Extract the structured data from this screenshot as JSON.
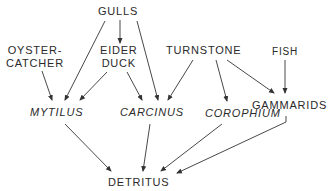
{
  "diagram": {
    "type": "food-web",
    "nodes": {
      "gulls": "GULLS",
      "oystercatcher_line1": "OYSTER-",
      "oystercatcher_line2": "CATCHER",
      "eider_line1": "EIDER",
      "eider_line2": "DUCK",
      "turnstone": "TURNSTONE",
      "fish": "FISH",
      "mytilus": "MYTILUS",
      "carcinus": "CARCINUS",
      "corophium": "COROPHIUM",
      "gammarids": "GAMMARIDS",
      "detritus": "DETRITUS"
    },
    "edges": [
      {
        "from": "GULLS",
        "to": "EIDER DUCK"
      },
      {
        "from": "GULLS",
        "to": "MYTILUS"
      },
      {
        "from": "GULLS",
        "to": "CARCINUS"
      },
      {
        "from": "OYSTER-CATCHER",
        "to": "MYTILUS"
      },
      {
        "from": "EIDER DUCK",
        "to": "MYTILUS"
      },
      {
        "from": "EIDER DUCK",
        "to": "CARCINUS"
      },
      {
        "from": "TURNSTONE",
        "to": "CARCINUS"
      },
      {
        "from": "TURNSTONE",
        "to": "COROPHIUM"
      },
      {
        "from": "TURNSTONE",
        "to": "GAMMARIDS"
      },
      {
        "from": "FISH",
        "to": "GAMMARIDS"
      },
      {
        "from": "MYTILUS",
        "to": "DETRITUS"
      },
      {
        "from": "CARCINUS",
        "to": "DETRITUS"
      },
      {
        "from": "COROPHIUM",
        "to": "DETRITUS"
      },
      {
        "from": "GAMMARIDS",
        "to": "DETRITUS"
      }
    ]
  }
}
